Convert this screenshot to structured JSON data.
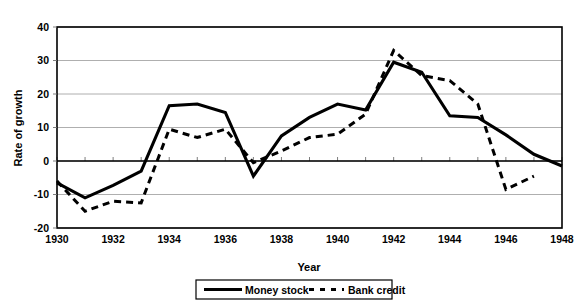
{
  "chart_data": {
    "type": "line",
    "title": "",
    "xlabel": "Year",
    "ylabel": "Rate of growth",
    "xlim": [
      1930,
      1948
    ],
    "ylim": [
      -20,
      40
    ],
    "ytick_step": 10,
    "xtick_step": 1,
    "xtick_label_step": 2,
    "grid": "horizontal",
    "legend_position": "bottom-center",
    "x": [
      1930,
      1931,
      1932,
      1933,
      1934,
      1935,
      1936,
      1937,
      1938,
      1939,
      1940,
      1941,
      1942,
      1943,
      1944,
      1945,
      1946,
      1947,
      1948
    ],
    "xticklabels": [
      "1930",
      "1932",
      "1934",
      "1936",
      "1938",
      "1940",
      "1942",
      "1944",
      "1946",
      "1948"
    ],
    "yticklabels": [
      "40",
      "30",
      "20",
      "10",
      "0",
      "-10",
      "-20"
    ],
    "series": [
      {
        "name": "Money stock",
        "style": "solid",
        "color": "#000000",
        "values": [
          -6.5,
          -11.0,
          -7.3,
          -3.0,
          16.5,
          17.0,
          14.5,
          -4.5,
          7.5,
          13.0,
          17.0,
          15.2,
          29.5,
          26.5,
          13.5,
          13.0,
          7.8,
          2.0,
          -1.5
        ]
      },
      {
        "name": "Bank credit",
        "style": "dashed",
        "color": "#000000",
        "values": [
          -6.0,
          -15.0,
          -12.0,
          -12.5,
          9.5,
          7.0,
          9.5,
          -0.5,
          3.0,
          7.0,
          8.0,
          14.0,
          33.0,
          25.5,
          24.0,
          17.0,
          -8.5,
          -4.5,
          null
        ]
      }
    ]
  },
  "legend": {
    "entries": [
      {
        "label": "Money stock",
        "style": "solid"
      },
      {
        "label": "Bank credit",
        "style": "dashed"
      }
    ]
  },
  "axes": {
    "y_title": "Rate of growth",
    "x_title": "Year"
  }
}
